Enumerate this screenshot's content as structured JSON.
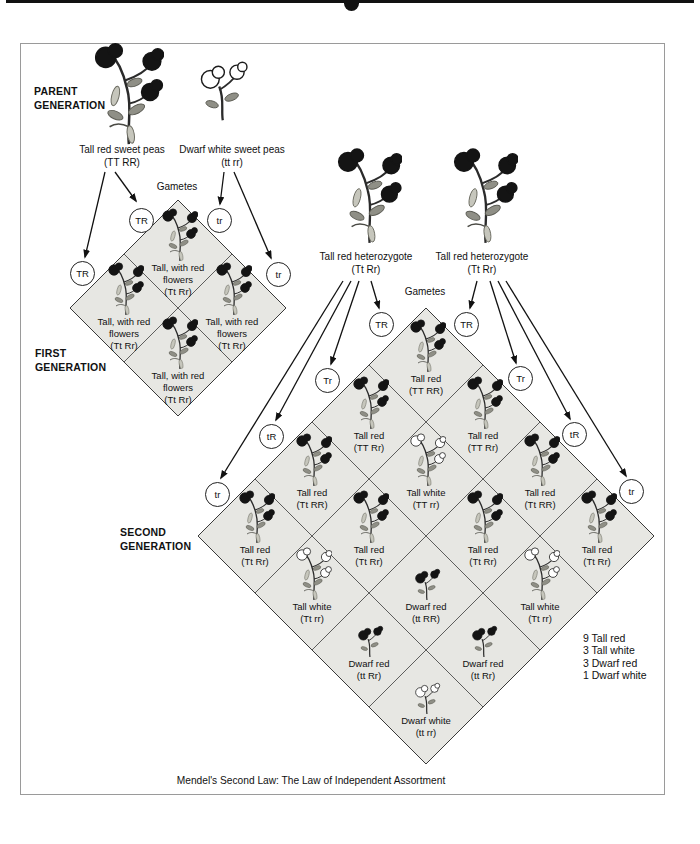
{
  "caption": "Mendel's Second Law: The Law of Independent Assortment",
  "parent_generation": {
    "label_line1": "PARENT",
    "label_line2": "GENERATION",
    "left_parent": {
      "name": "Tall red sweet peas",
      "genotype": "(TT RR)",
      "plant": "tall-red"
    },
    "right_parent": {
      "name": "Dwarf white sweet peas",
      "genotype": "(tt rr)",
      "plant": "dwarf-white"
    },
    "gametes_label": "Gametes",
    "inner_gametes": [
      "TR",
      "tr"
    ],
    "outer_gametes": [
      "TR",
      "tr"
    ]
  },
  "first_generation": {
    "label_line1": "FIRST",
    "label_line2": "GENERATION",
    "cells": [
      {
        "line1": "Tall, with red",
        "line2": "flowers",
        "genotype": "(Tt Rr)",
        "plant": "tall-red"
      },
      {
        "line1": "Tall, with red",
        "line2": "flowers",
        "genotype": "(Tt Rr)",
        "plant": "tall-red"
      },
      {
        "line1": "Tall, with red",
        "line2": "flowers",
        "genotype": "(Tt Rr)",
        "plant": "tall-red"
      },
      {
        "line1": "Tall, with red",
        "line2": "flowers",
        "genotype": "(Tt Rr)",
        "plant": "tall-red"
      }
    ]
  },
  "second_generation": {
    "label_line1": "SECOND",
    "label_line2": "GENERATION",
    "parents": [
      {
        "name": "Tall red heterozygote",
        "genotype": "(Tt Rr)",
        "plant": "tall-red"
      },
      {
        "name": "Tall red heterozygote",
        "genotype": "(Tt Rr)",
        "plant": "tall-red"
      }
    ],
    "gametes_label": "Gametes",
    "left_gametes": [
      "TR",
      "Tr",
      "tR",
      "tr"
    ],
    "right_gametes": [
      "TR",
      "Tr",
      "tR",
      "tr"
    ],
    "cells": [
      {
        "name": "Tall red",
        "genotype": "(TT RR)",
        "plant": "tall-red"
      },
      {
        "name": "Tall red",
        "genotype": "(TT Rr)",
        "plant": "tall-red"
      },
      {
        "name": "Tall red",
        "genotype": "(TT Rr)",
        "plant": "tall-red"
      },
      {
        "name": "Tall red",
        "genotype": "(Tt RR)",
        "plant": "tall-red"
      },
      {
        "name": "Tall white",
        "genotype": "(TT rr)",
        "plant": "tall-white"
      },
      {
        "name": "Tall red",
        "genotype": "(Tt RR)",
        "plant": "tall-red"
      },
      {
        "name": "Tall red",
        "genotype": "(Tt Rr)",
        "plant": "tall-red"
      },
      {
        "name": "Tall red",
        "genotype": "(Tt Rr)",
        "plant": "tall-red"
      },
      {
        "name": "Tall red",
        "genotype": "(Tt Rr)",
        "plant": "tall-red"
      },
      {
        "name": "Tall red",
        "genotype": "(Tt Rr)",
        "plant": "tall-red"
      },
      {
        "name": "Tall white",
        "genotype": "(Tt rr)",
        "plant": "tall-white"
      },
      {
        "name": "Dwarf red",
        "genotype": "(tt RR)",
        "plant": "dwarf-red"
      },
      {
        "name": "Tall white",
        "genotype": "(Tt rr)",
        "plant": "tall-white"
      },
      {
        "name": "Dwarf red",
        "genotype": "(tt Rr)",
        "plant": "dwarf-red"
      },
      {
        "name": "Dwarf red",
        "genotype": "(tt Rr)",
        "plant": "dwarf-red"
      },
      {
        "name": "Dwarf white",
        "genotype": "(tt rr)",
        "plant": "dwarf-white"
      }
    ],
    "ratio": [
      "9 Tall red",
      "3 Tall white",
      "3 Dwarf red",
      "1 Dwarf white"
    ]
  }
}
